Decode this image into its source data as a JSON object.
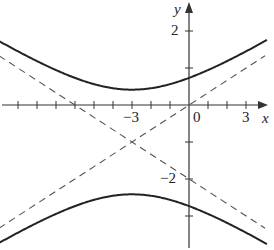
{
  "chart_data": {
    "type": "line",
    "title": "",
    "xlabel": "x",
    "ylabel": "y",
    "x_tick_labels": [
      {
        "value": -3,
        "label": "−3"
      },
      {
        "value": 0,
        "label": "0"
      },
      {
        "value": 3,
        "label": "3"
      }
    ],
    "y_tick_labels": [
      {
        "value": 2,
        "label": "2"
      },
      {
        "value": -2,
        "label": "−2"
      }
    ],
    "x_ticks": [
      -9,
      -8,
      -7,
      -6,
      -5,
      -4,
      -3,
      -2,
      -1,
      1,
      2,
      3
    ],
    "y_ticks": [
      2,
      1,
      -1,
      -2,
      -3
    ],
    "xlim": [
      -10,
      4.5
    ],
    "ylim": [
      -3.9,
      2.8
    ],
    "grid": false,
    "legend": null,
    "series": [
      {
        "name": "hyperbola upper branch",
        "style": "solid",
        "equation": "(y+1)^2/2 - (x+3)^2/18 = 1, upper",
        "x": [
          -10,
          -8,
          -6,
          -4,
          -3,
          -2,
          0,
          2,
          4
        ],
        "y": [
          1.2,
          0.7,
          0.73,
          0.43,
          0.41,
          0.43,
          0.73,
          1.2,
          1.85
        ]
      },
      {
        "name": "hyperbola lower branch",
        "style": "solid",
        "equation": "(y+1)^2/2 - (x+3)^2/18 = 1, lower",
        "x": [
          -10,
          -8,
          -6,
          -4,
          -3,
          -2,
          0,
          2,
          4
        ],
        "y": [
          -3.2,
          -2.7,
          -2.73,
          -2.43,
          -2.41,
          -2.43,
          -2.73,
          -3.2,
          -3.85
        ]
      },
      {
        "name": "asymptote y = x/3",
        "style": "dashed",
        "x": [
          -10,
          4
        ],
        "y": [
          -3.33,
          1.33
        ]
      },
      {
        "name": "asymptote y = -x/3 - 2",
        "style": "dashed",
        "x": [
          -10,
          4
        ],
        "y": [
          1.33,
          -3.33
        ]
      }
    ],
    "annotations": {
      "center": [
        -3,
        -1
      ]
    }
  },
  "labels": {
    "x_axis": "x",
    "y_axis": "y",
    "tick_x_neg3": "−3",
    "tick_x_0": "0",
    "tick_x_3": "3",
    "tick_y_2": "2",
    "tick_y_neg2": "−2"
  }
}
